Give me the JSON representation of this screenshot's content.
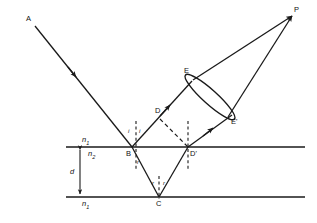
{
  "figure": {
    "kind": "ray-diagram",
    "background": "#ffffff",
    "ink": "#1a1a1a"
  },
  "media": {
    "above": "n",
    "above_sub": "1",
    "film": "n",
    "film_sub": "2",
    "below": "n",
    "below_sub": "1",
    "thickness_label": "d"
  },
  "points": [
    {
      "id": "A",
      "label": "A",
      "x": 30,
      "y": 20,
      "role": "incident-ray-source"
    },
    {
      "id": "B",
      "label": "B",
      "x": 132,
      "y": 152,
      "role": "top-surface-incidence-point"
    },
    {
      "id": "C",
      "label": "C",
      "x": 159,
      "y": 205,
      "role": "bottom-surface-reflection-point"
    },
    {
      "id": "D",
      "label": "D",
      "x": 157,
      "y": 113,
      "role": "wavefront-point"
    },
    {
      "id": "D'",
      "label": "D'",
      "x": 188,
      "y": 152,
      "role": "emergence-point"
    },
    {
      "id": "E",
      "label": "E",
      "x": 188,
      "y": 73,
      "role": "lens-upper-edge"
    },
    {
      "id": "E'",
      "label": "E'",
      "x": 232,
      "y": 122,
      "role": "lens-lower-edge"
    },
    {
      "id": "P",
      "label": "P",
      "x": 296,
      "y": 11,
      "role": "image-point"
    }
  ],
  "angles": [
    {
      "label": "i",
      "x": 130,
      "y": 131,
      "at": "B",
      "side": "left",
      "meaning": "angle of incidence"
    },
    {
      "label": "i",
      "x": 141,
      "y": 131,
      "at": "B",
      "side": "right",
      "meaning": "angle of reflection"
    },
    {
      "label": "r",
      "x": 138,
      "y": 161,
      "at": "B",
      "side": "right",
      "meaning": "angle of refraction"
    },
    {
      "label": "r",
      "x": 155,
      "y": 181,
      "at": "C",
      "side": "left",
      "meaning": "angle of incidence in film"
    },
    {
      "label": "r",
      "x": 165,
      "y": 181,
      "at": "C",
      "side": "right",
      "meaning": "angle of reflection in film"
    }
  ],
  "rays": [
    {
      "name": "incident-ray-A-to-B",
      "from": "A",
      "to": "B",
      "style": "solid",
      "arrow": "mid"
    },
    {
      "name": "reflected-ray-B-to-E",
      "from": "B",
      "to": "E",
      "style": "solid",
      "arrow": "mid"
    },
    {
      "name": "refracted-ray-B-to-C",
      "from": "B",
      "to": "C",
      "style": "solid",
      "arrow": "none"
    },
    {
      "name": "internal-reflected-ray-C-to-Dprime",
      "from": "C",
      "to": "D'",
      "style": "solid",
      "arrow": "none"
    },
    {
      "name": "emergent-ray-Dprime-to-Eprime",
      "from": "D'",
      "to": "E'",
      "style": "solid",
      "arrow": "mid"
    },
    {
      "name": "lens-ray-E-to-P",
      "from": "E",
      "to": "P",
      "style": "solid",
      "arrow": "end"
    },
    {
      "name": "lens-ray-Eprime-to-P",
      "from": "E'",
      "to": "P",
      "style": "solid",
      "arrow": "end"
    },
    {
      "name": "wavefront-D-to-Dprime",
      "from": "D",
      "to": "D'",
      "style": "dashed",
      "arrow": "none"
    }
  ],
  "normals": [
    {
      "name": "normal-at-B",
      "x": 136,
      "y_top": 120,
      "y_bottom": 172,
      "style": "dashed"
    },
    {
      "name": "normal-at-Dprime",
      "x": 188,
      "y_top": 120,
      "y_bottom": 172,
      "style": "dashed"
    },
    {
      "name": "normal-at-C",
      "x": 159,
      "y_top": 176,
      "y_bottom": 200,
      "style": "dashed"
    }
  ],
  "surfaces": [
    {
      "name": "top-interface",
      "y": 147,
      "x1": 66,
      "x2": 305
    },
    {
      "name": "bottom-interface",
      "y": 197,
      "x1": 66,
      "x2": 305
    }
  ],
  "lens": {
    "name": "converging-lens",
    "cx": 210,
    "cy": 97,
    "rx": 7,
    "ry": 33,
    "angle_deg": -48
  },
  "thickness_arrow": {
    "x": 80,
    "y_top": 147,
    "y_bottom": 197
  }
}
